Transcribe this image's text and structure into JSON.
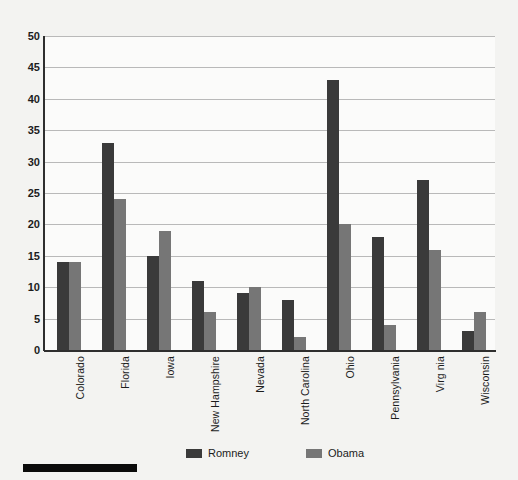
{
  "chart_data": {
    "type": "bar",
    "title": "",
    "subtitle": "",
    "xlabel": "",
    "ylabel": "",
    "ylim": [
      0,
      50
    ],
    "ytick_step": 5,
    "yticks": [
      50,
      45,
      40,
      35,
      30,
      25,
      20,
      15,
      10,
      5,
      0
    ],
    "grid": true,
    "legend_position": "bottom",
    "categories": [
      "Colorado",
      "Florida",
      "Iowa",
      "New Hampshire",
      "Nevada",
      "North Carolina",
      "Ohio",
      "Pennsylvania",
      "Virg nia",
      "Wisconsin"
    ],
    "series": [
      {
        "name": "Romney",
        "color": "#3a3a3a",
        "values": [
          14,
          33,
          15,
          11,
          9,
          8,
          43,
          18,
          27,
          3
        ]
      },
      {
        "name": "Obama",
        "color": "#767676",
        "values": [
          14,
          24,
          19,
          6,
          10,
          2,
          20,
          4,
          16,
          6
        ]
      }
    ]
  },
  "legend": {
    "items": [
      {
        "label": "Romney",
        "color": "#3a3a3a"
      },
      {
        "label": "Obama",
        "color": "#767676"
      }
    ]
  },
  "colors": {
    "background": "#f3f3f1",
    "plot_background": "#fbfbfa",
    "gridline": "#b9b9b9",
    "axis": "#2e2e2e",
    "text": "#1c1c1c",
    "series_romney": "#3a3a3a",
    "series_obama": "#767676",
    "scale_bar": "#0b0b0b"
  },
  "scale_bar": {
    "name": "scale-bar"
  }
}
